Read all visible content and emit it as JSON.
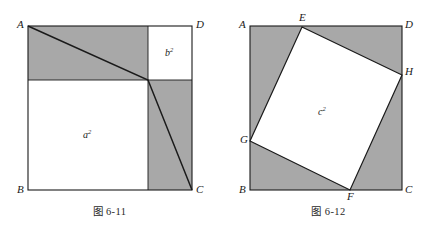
{
  "page": {
    "width": 438,
    "height": 235,
    "background": "#ffffff"
  },
  "style": {
    "shade_color": "#a8a8a8",
    "white_color": "#ffffff",
    "line_color": "#1a1a1a",
    "text_color": "#1a1a1a"
  },
  "figures": [
    {
      "id": "fig-6-11",
      "caption": "图 6-11",
      "square": {
        "label_a": "A",
        "label_b": "B",
        "label_c": "C",
        "label_d": "D"
      },
      "vertices": {
        "A": {
          "label": "A",
          "x": 28,
          "y": 26
        },
        "D": {
          "label": "D",
          "x": 192,
          "y": 26
        },
        "C": {
          "label": "C",
          "x": 192,
          "y": 190
        },
        "B": {
          "label": "B",
          "x": 28,
          "y": 190
        }
      },
      "areas": [
        {
          "name": "a-square",
          "base": "a",
          "exponent": "2",
          "x": 88,
          "y": 135
        },
        {
          "name": "b-square",
          "base": "b",
          "exponent": "2",
          "x": 170,
          "y": 53
        }
      ]
    },
    {
      "id": "fig-6-12",
      "caption": "图 6-12",
      "square": {
        "label_a": "A",
        "label_b": "B",
        "label_c": "C",
        "label_d": "D"
      },
      "vertices": {
        "A": {
          "label": "A",
          "x": 250,
          "y": 26
        },
        "D": {
          "label": "D",
          "x": 402,
          "y": 26
        },
        "C": {
          "label": "C",
          "x": 402,
          "y": 190
        },
        "B": {
          "label": "B",
          "x": 250,
          "y": 190
        },
        "E": {
          "label": "E",
          "x": 302,
          "y": 27
        },
        "H": {
          "label": "H",
          "x": 402,
          "y": 75
        },
        "F": {
          "label": "F",
          "x": 350,
          "y": 190
        },
        "G": {
          "label": "G",
          "x": 250,
          "y": 141
        }
      },
      "areas": [
        {
          "name": "c-square",
          "base": "c",
          "exponent": "2",
          "x": 322,
          "y": 112
        }
      ]
    }
  ]
}
